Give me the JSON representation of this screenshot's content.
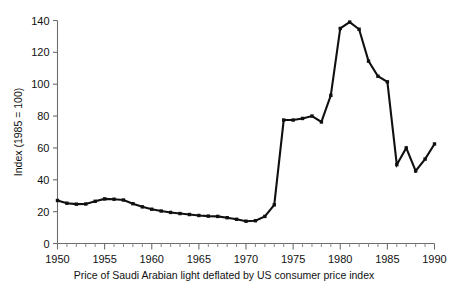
{
  "chart_data": {
    "type": "line",
    "title": "",
    "caption": "Price of Saudi Arabian light deflated by US consumer price index",
    "xlabel": "",
    "ylabel": "Index (1985 = 100)",
    "xlim": [
      1950,
      1990
    ],
    "ylim": [
      0,
      140
    ],
    "grid": false,
    "legend": "none",
    "x_major_ticks": [
      1950,
      1955,
      1960,
      1965,
      1970,
      1975,
      1980,
      1985,
      1990
    ],
    "x_minor_tick_step": 1,
    "y_ticks": [
      0,
      20,
      40,
      60,
      80,
      100,
      120,
      140
    ],
    "x_tick_labels": [
      "1950",
      "1955",
      "1960",
      "1965",
      "1970",
      "1975",
      "1980",
      "1985",
      "1990"
    ],
    "y_tick_labels": [
      "0",
      "20",
      "40",
      "60",
      "80",
      "100",
      "120",
      "140"
    ],
    "series": [
      {
        "name": "Price of Saudi Arabian light (deflated)",
        "color": "#101010",
        "marker": "square",
        "x": [
          1950,
          1951,
          1952,
          1953,
          1954,
          1955,
          1956,
          1957,
          1958,
          1959,
          1960,
          1961,
          1962,
          1963,
          1964,
          1965,
          1966,
          1967,
          1968,
          1969,
          1970,
          1971,
          1972,
          1973,
          1974,
          1975,
          1976,
          1977,
          1978,
          1979,
          1980,
          1981,
          1982,
          1983,
          1984,
          1985,
          1986,
          1987,
          1988,
          1989,
          1990
        ],
        "values": [
          27.0,
          25.3,
          24.7,
          24.8,
          26.5,
          28.0,
          27.8,
          27.3,
          25.0,
          23.0,
          21.5,
          20.4,
          19.5,
          18.8,
          18.2,
          17.6,
          17.2,
          17.0,
          16.2,
          15.2,
          14.0,
          14.3,
          17.0,
          24.3,
          77.5,
          77.5,
          78.5,
          80.0,
          76.3,
          93.0,
          135.0,
          139.0,
          134.5,
          114.5,
          105.0,
          101.5,
          49.5,
          60.0,
          45.5,
          53.0,
          62.5
        ]
      }
    ]
  },
  "axes": {
    "y_axis_title": "Index (1985 = 100)"
  },
  "caption": {
    "text": "Price of Saudi Arabian light deflated by US consumer price index"
  }
}
